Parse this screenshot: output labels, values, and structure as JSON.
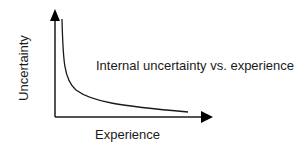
{
  "diagram": {
    "title": "Internal uncertainty vs. experience",
    "x_axis_label": "Experience",
    "y_axis_label": "Uncertainty",
    "line_color": "#1a1a1a",
    "curve_shape": "decreasing hyperbolic"
  }
}
